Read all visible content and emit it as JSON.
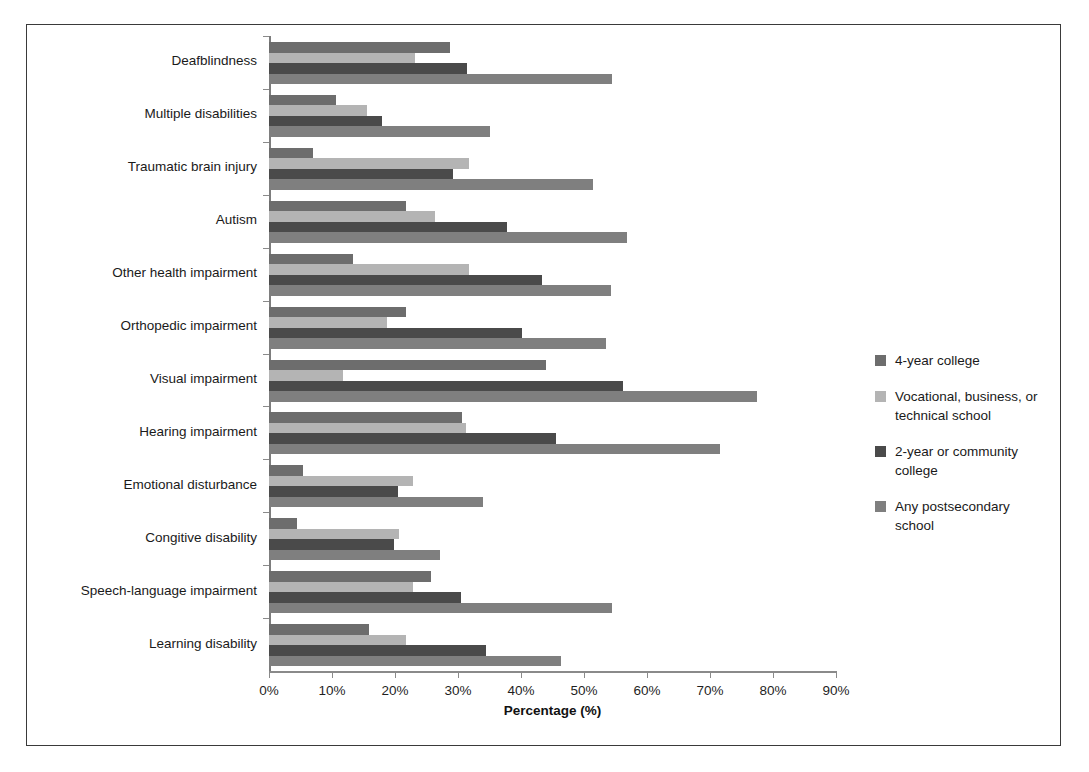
{
  "chart_data": {
    "type": "bar",
    "orientation": "horizontal",
    "title": "",
    "xlabel": "Percentage (%)",
    "ylabel": "",
    "xlim": [
      0,
      90
    ],
    "xticks": [
      "0%",
      "10%",
      "20%",
      "30%",
      "40%",
      "50%",
      "60%",
      "70%",
      "80%",
      "90%"
    ],
    "xtick_values": [
      0,
      10,
      20,
      30,
      40,
      50,
      60,
      70,
      80,
      90
    ],
    "grid": false,
    "legend_position": "right",
    "categories": [
      "Deafblindness",
      "Multiple disabilities",
      "Traumatic brain injury",
      "Autism",
      "Other health impairment",
      "Orthopedic impairment",
      "Visual impairment",
      "Hearing impairment",
      "Emotional disturbance",
      "Congitive disability",
      "Speech-language impairment",
      "Learning disability"
    ],
    "series": [
      {
        "name": "4-year college",
        "color": "#6d6d6d",
        "values": [
          28.8,
          10.7,
          7.0,
          21.7,
          13.3,
          21.8,
          43.9,
          30.6,
          5.4,
          4.4,
          25.7,
          15.8
        ]
      },
      {
        "name": "Vocational, business, or technical school",
        "color": "#b4b4b4",
        "values": [
          23.2,
          15.5,
          31.7,
          26.3,
          31.8,
          18.7,
          11.8,
          31.2,
          22.9,
          20.6,
          22.9,
          21.8
        ]
      },
      {
        "name": "2-year or community college",
        "color": "#4a4a4a",
        "values": [
          31.4,
          17.9,
          29.2,
          37.7,
          43.4,
          40.1,
          56.2,
          45.6,
          20.5,
          19.9,
          30.4,
          34.4
        ]
      },
      {
        "name": "Any postsecondary school",
        "color": "#7f7f7f",
        "values": [
          54.4,
          35.0,
          51.5,
          56.8,
          54.3,
          53.5,
          77.5,
          71.6,
          34.0,
          27.2,
          54.5,
          46.3
        ]
      }
    ]
  },
  "axis": {
    "x_title": "Percentage (%)"
  },
  "legend": {
    "items": [
      {
        "label": "4-year college",
        "color": "#6d6d6d"
      },
      {
        "label": "Vocational, business, or technical school",
        "color": "#b4b4b4"
      },
      {
        "label": "2-year or community college",
        "color": "#4a4a4a"
      },
      {
        "label": "Any postsecondary school",
        "color": "#7f7f7f"
      }
    ]
  }
}
